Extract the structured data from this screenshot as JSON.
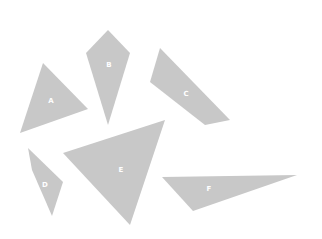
{
  "canvas": {
    "width": 322,
    "height": 239,
    "background": "#ffffff",
    "shape_color": "#c8c8c8",
    "label_color": "#ffffff"
  },
  "shapes": [
    {
      "id": "A",
      "label": "A",
      "type": "triangle",
      "points": "43,63 88,109 20,133",
      "label_pos": [
        51,
        101
      ]
    },
    {
      "id": "B",
      "label": "B",
      "type": "kite",
      "points": "108,30 130,53 108,125 86,53",
      "label_pos": [
        109,
        65
      ]
    },
    {
      "id": "C",
      "label": "C",
      "type": "quadrilateral",
      "points": "160,48 230,120 205,125 150,82",
      "label_pos": [
        186,
        94
      ]
    },
    {
      "id": "D",
      "label": "D",
      "type": "quadrilateral",
      "points": "28,148 63,182 52,216 32,170",
      "label_pos": [
        45,
        185
      ]
    },
    {
      "id": "E",
      "label": "E",
      "type": "triangle",
      "points": "63,153 165,120 130,225",
      "label_pos": [
        121,
        170
      ]
    },
    {
      "id": "F",
      "label": "F",
      "type": "triangle",
      "points": "162,177 297,175 193,211",
      "label_pos": [
        209,
        189
      ]
    }
  ]
}
